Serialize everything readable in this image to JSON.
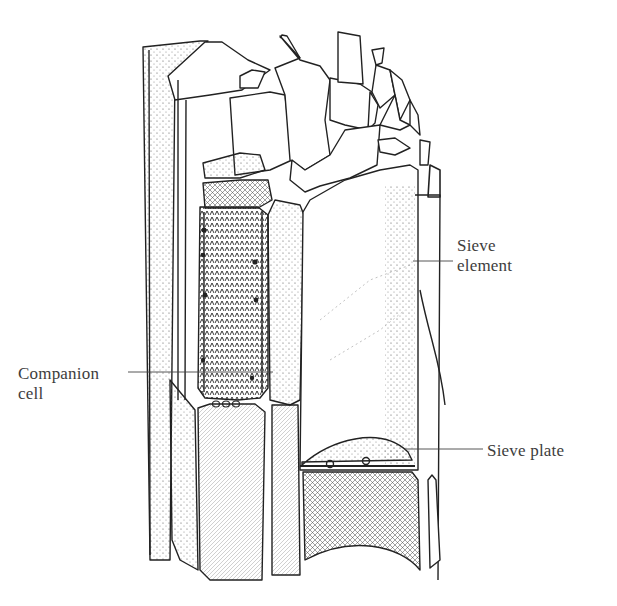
{
  "figure": {
    "labels": {
      "sieve_element": [
        "Sieve",
        "element"
      ],
      "companion_cell": [
        "Companion",
        "cell"
      ],
      "sieve_plate": "Sieve plate"
    },
    "colors": {
      "ink": "#222222",
      "label_text": "#3d3d3d",
      "background": "#ffffff"
    }
  }
}
